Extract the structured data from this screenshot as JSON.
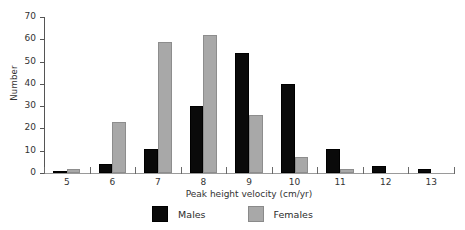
{
  "chart_data": {
    "type": "bar",
    "title": "",
    "xlabel": "Peak height velocity (cm/yr)",
    "ylabel": "Number",
    "categories": [
      "5",
      "6",
      "7",
      "8",
      "9",
      "10",
      "11",
      "12",
      "13"
    ],
    "series": [
      {
        "name": "Males",
        "color": "#0a0a0a",
        "values": [
          1,
          4,
          11,
          30,
          54,
          40,
          11,
          3,
          2
        ]
      },
      {
        "name": "Females",
        "color": "#a8a8a8",
        "values": [
          2,
          23,
          59,
          62,
          26,
          7,
          2,
          0,
          0
        ]
      }
    ],
    "ylim": [
      0,
      70
    ],
    "ytick_values": [
      0,
      10,
      20,
      30,
      40,
      50,
      60,
      70
    ],
    "ytick_labels": [
      "0",
      "10",
      "20",
      "30",
      "40",
      "50",
      "60",
      "70"
    ],
    "xtick_labels": [
      "5",
      "6",
      "7",
      "8",
      "9",
      "10",
      "11",
      "12",
      "13"
    ],
    "grid": false,
    "legend_position": "bottom-center",
    "legend_entries": [
      "Males",
      "Females"
    ]
  },
  "legend": {
    "items": [
      {
        "label": "Males"
      },
      {
        "label": "Females"
      }
    ]
  }
}
